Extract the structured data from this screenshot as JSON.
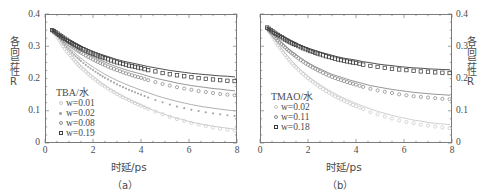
{
  "figure": {
    "axis_title_y": "各向异性R",
    "axis_title_x": "时延/ps",
    "caption_a": "（a）",
    "caption_b": "（b）"
  },
  "panels": {
    "a": {
      "legend_title": "TBA/水",
      "caption": "（a）",
      "yticks": [
        "0.4",
        "0.3",
        "0.2",
        "0.1",
        "0"
      ],
      "xticks": [
        "0",
        "2",
        "4",
        "6",
        "8"
      ]
    },
    "b": {
      "legend_title": "TMAO/水",
      "caption": "（b）",
      "yticks": [
        "0.4",
        "0.3",
        "0.2",
        "0.1",
        "0"
      ],
      "xticks": [
        "0",
        "2",
        "4",
        "6",
        "8"
      ]
    }
  },
  "chart_data": [
    {
      "type": "scatter",
      "panel": "a",
      "title": "TBA/水",
      "xlabel": "时延/ps",
      "ylabel": "各向异性R",
      "xlim": [
        0,
        8
      ],
      "ylim": [
        0,
        0.4
      ],
      "xticks": [
        0,
        2,
        4,
        6,
        8
      ],
      "yticks": [
        0,
        0.1,
        0.2,
        0.3,
        0.4
      ],
      "grid": false,
      "legend_position": "inside-left",
      "series": [
        {
          "name": "w=0.01",
          "marker": "circle-open",
          "color": "#c9c9c9",
          "points_x": [
            0.3,
            0.45,
            0.6,
            0.75,
            0.9,
            1.05,
            1.2,
            1.35,
            1.5,
            1.7,
            1.9,
            2.1,
            2.3,
            2.5,
            2.75,
            3.0,
            3.25,
            3.5,
            3.75,
            4.0,
            4.3,
            4.6,
            4.9,
            5.2,
            5.5,
            5.8,
            6.1,
            6.4,
            6.7,
            7.0,
            7.3,
            7.6,
            7.9
          ],
          "points_y": [
            0.35,
            0.335,
            0.318,
            0.3,
            0.285,
            0.272,
            0.258,
            0.245,
            0.234,
            0.221,
            0.208,
            0.196,
            0.185,
            0.175,
            0.163,
            0.152,
            0.142,
            0.133,
            0.124,
            0.116,
            0.106,
            0.097,
            0.089,
            0.081,
            0.074,
            0.068,
            0.062,
            0.057,
            0.052,
            0.048,
            0.044,
            0.041,
            0.038
          ],
          "fit_y": [
            0.35,
            0.334,
            0.319,
            0.304,
            0.29,
            0.277,
            0.264,
            0.252,
            0.24,
            0.226,
            0.213,
            0.201,
            0.189,
            0.178,
            0.166,
            0.155,
            0.145,
            0.135,
            0.126,
            0.118,
            0.108,
            0.099,
            0.091,
            0.083,
            0.077,
            0.071,
            0.065,
            0.06,
            0.056,
            0.052,
            0.049,
            0.046,
            0.043
          ]
        },
        {
          "name": "w=0.02",
          "marker": "dot-filled",
          "color": "#a8a8a8",
          "points_x": [
            0.3,
            0.45,
            0.6,
            0.75,
            0.9,
            1.05,
            1.2,
            1.35,
            1.5,
            1.7,
            1.9,
            2.1,
            2.3,
            2.5,
            2.75,
            3.0,
            3.25,
            3.5,
            3.75,
            4.0,
            4.3,
            4.6,
            4.9,
            5.2,
            5.5,
            5.8,
            6.1,
            6.4,
            6.7,
            7.0,
            7.3,
            7.6,
            7.9
          ],
          "points_y": [
            0.35,
            0.338,
            0.324,
            0.31,
            0.297,
            0.286,
            0.274,
            0.264,
            0.254,
            0.242,
            0.231,
            0.221,
            0.211,
            0.202,
            0.192,
            0.182,
            0.173,
            0.165,
            0.157,
            0.15,
            0.141,
            0.133,
            0.126,
            0.119,
            0.113,
            0.108,
            0.103,
            0.099,
            0.095,
            0.092,
            0.089,
            0.086,
            0.084
          ],
          "fit_y": [
            0.35,
            0.338,
            0.326,
            0.314,
            0.303,
            0.292,
            0.282,
            0.272,
            0.263,
            0.251,
            0.241,
            0.231,
            0.222,
            0.213,
            0.203,
            0.194,
            0.186,
            0.178,
            0.171,
            0.164,
            0.156,
            0.148,
            0.141,
            0.135,
            0.129,
            0.124,
            0.119,
            0.115,
            0.111,
            0.108,
            0.105,
            0.102,
            0.1
          ]
        },
        {
          "name": "w=0.08",
          "marker": "circle-open",
          "color": "#8a8a8a",
          "points_x": [
            0.3,
            0.45,
            0.6,
            0.75,
            0.9,
            1.05,
            1.2,
            1.35,
            1.5,
            1.7,
            1.9,
            2.1,
            2.3,
            2.5,
            2.75,
            3.0,
            3.25,
            3.5,
            3.75,
            4.0,
            4.3,
            4.6,
            4.9,
            5.2,
            5.5,
            5.8,
            6.1,
            6.4,
            6.7,
            7.0,
            7.3,
            7.6,
            7.9
          ],
          "points_y": [
            0.35,
            0.341,
            0.331,
            0.321,
            0.312,
            0.303,
            0.295,
            0.287,
            0.28,
            0.271,
            0.263,
            0.255,
            0.248,
            0.241,
            0.233,
            0.226,
            0.219,
            0.213,
            0.207,
            0.202,
            0.195,
            0.189,
            0.183,
            0.178,
            0.173,
            0.169,
            0.165,
            0.161,
            0.158,
            0.155,
            0.152,
            0.15,
            0.148
          ],
          "fit_y": [
            0.35,
            0.341,
            0.332,
            0.324,
            0.316,
            0.308,
            0.301,
            0.294,
            0.287,
            0.279,
            0.271,
            0.264,
            0.257,
            0.251,
            0.243,
            0.236,
            0.23,
            0.224,
            0.219,
            0.214,
            0.207,
            0.201,
            0.196,
            0.191,
            0.186,
            0.182,
            0.178,
            0.175,
            0.172,
            0.169,
            0.167,
            0.164,
            0.162
          ]
        },
        {
          "name": "w=0.19",
          "marker": "square-open",
          "color": "#3c3c3c",
          "points_x": [
            0.3,
            0.45,
            0.6,
            0.75,
            0.9,
            1.05,
            1.2,
            1.35,
            1.5,
            1.7,
            1.9,
            2.1,
            2.3,
            2.5,
            2.75,
            3.0,
            3.25,
            3.5,
            3.75,
            4.0,
            4.3,
            4.6,
            4.9,
            5.2,
            5.5,
            5.8,
            6.1,
            6.4,
            6.7,
            7.0,
            7.3,
            7.6,
            7.9
          ],
          "points_y": [
            0.35,
            0.343,
            0.335,
            0.327,
            0.32,
            0.313,
            0.306,
            0.3,
            0.294,
            0.287,
            0.28,
            0.274,
            0.268,
            0.263,
            0.256,
            0.25,
            0.245,
            0.24,
            0.236,
            0.232,
            0.226,
            0.222,
            0.217,
            0.213,
            0.21,
            0.207,
            0.204,
            0.201,
            0.199,
            0.197,
            0.195,
            0.193,
            0.192
          ],
          "fit_y": [
            0.35,
            0.343,
            0.336,
            0.329,
            0.323,
            0.317,
            0.311,
            0.305,
            0.3,
            0.293,
            0.287,
            0.281,
            0.276,
            0.271,
            0.265,
            0.259,
            0.254,
            0.25,
            0.246,
            0.242,
            0.237,
            0.233,
            0.229,
            0.225,
            0.222,
            0.219,
            0.216,
            0.214,
            0.212,
            0.21,
            0.208,
            0.207,
            0.205
          ]
        }
      ]
    },
    {
      "type": "scatter",
      "panel": "b",
      "title": "TMAO/水",
      "xlabel": "时延/ps",
      "ylabel": "各向异性R",
      "xlim": [
        0,
        8
      ],
      "ylim": [
        0,
        0.4
      ],
      "xticks": [
        0,
        2,
        4,
        6,
        8
      ],
      "yticks": [
        0,
        0.1,
        0.2,
        0.3,
        0.4
      ],
      "grid": false,
      "legend_position": "inside-left",
      "series": [
        {
          "name": "w=0.02",
          "marker": "circle-open",
          "color": "#c9c9c9",
          "points_x": [
            0.3,
            0.45,
            0.6,
            0.75,
            0.9,
            1.05,
            1.2,
            1.35,
            1.5,
            1.7,
            1.9,
            2.1,
            2.3,
            2.5,
            2.75,
            3.0,
            3.25,
            3.5,
            3.75,
            4.0,
            4.3,
            4.6,
            4.9,
            5.2,
            5.5,
            5.8,
            6.1,
            6.4,
            6.7,
            7.0,
            7.3,
            7.6,
            7.9
          ],
          "points_y": [
            0.355,
            0.338,
            0.32,
            0.303,
            0.288,
            0.273,
            0.259,
            0.246,
            0.234,
            0.22,
            0.207,
            0.195,
            0.184,
            0.173,
            0.161,
            0.15,
            0.14,
            0.131,
            0.122,
            0.114,
            0.105,
            0.096,
            0.089,
            0.082,
            0.076,
            0.07,
            0.065,
            0.061,
            0.057,
            0.054,
            0.051,
            0.048,
            0.046
          ],
          "fit_y": [
            0.355,
            0.338,
            0.322,
            0.306,
            0.292,
            0.278,
            0.265,
            0.253,
            0.241,
            0.227,
            0.214,
            0.202,
            0.191,
            0.181,
            0.169,
            0.158,
            0.148,
            0.139,
            0.131,
            0.123,
            0.114,
            0.106,
            0.098,
            0.092,
            0.086,
            0.08,
            0.076,
            0.071,
            0.068,
            0.064,
            0.061,
            0.059,
            0.057
          ]
        },
        {
          "name": "w=0.11",
          "marker": "circle-open",
          "color": "#8a8a8a",
          "points_x": [
            0.3,
            0.45,
            0.6,
            0.75,
            0.9,
            1.05,
            1.2,
            1.35,
            1.5,
            1.7,
            1.9,
            2.1,
            2.3,
            2.5,
            2.75,
            3.0,
            3.25,
            3.5,
            3.75,
            4.0,
            4.3,
            4.6,
            4.9,
            5.2,
            5.5,
            5.8,
            6.1,
            6.4,
            6.7,
            7.0,
            7.3,
            7.6,
            7.9
          ],
          "points_y": [
            0.355,
            0.343,
            0.33,
            0.318,
            0.307,
            0.296,
            0.286,
            0.277,
            0.268,
            0.257,
            0.247,
            0.238,
            0.23,
            0.222,
            0.213,
            0.205,
            0.198,
            0.192,
            0.186,
            0.181,
            0.174,
            0.168,
            0.163,
            0.159,
            0.155,
            0.151,
            0.148,
            0.145,
            0.143,
            0.141,
            0.139,
            0.137,
            0.136
          ],
          "fit_y": [
            0.355,
            0.343,
            0.332,
            0.321,
            0.311,
            0.301,
            0.292,
            0.283,
            0.275,
            0.264,
            0.254,
            0.245,
            0.237,
            0.23,
            0.221,
            0.213,
            0.207,
            0.201,
            0.195,
            0.19,
            0.184,
            0.178,
            0.174,
            0.17,
            0.166,
            0.163,
            0.16,
            0.157,
            0.155,
            0.153,
            0.151,
            0.15,
            0.148
          ]
        },
        {
          "name": "w=0.18",
          "marker": "square-open",
          "color": "#3c3c3c",
          "points_x": [
            0.3,
            0.45,
            0.6,
            0.75,
            0.9,
            1.05,
            1.2,
            1.35,
            1.5,
            1.7,
            1.9,
            2.1,
            2.3,
            2.5,
            2.75,
            3.0,
            3.25,
            3.5,
            3.75,
            4.0,
            4.3,
            4.6,
            4.9,
            5.2,
            5.5,
            5.8,
            6.1,
            6.4,
            6.7,
            7.0,
            7.3,
            7.6,
            7.9
          ],
          "points_y": [
            0.358,
            0.35,
            0.342,
            0.335,
            0.328,
            0.321,
            0.315,
            0.309,
            0.304,
            0.297,
            0.291,
            0.285,
            0.28,
            0.275,
            0.269,
            0.264,
            0.259,
            0.255,
            0.251,
            0.248,
            0.243,
            0.239,
            0.236,
            0.233,
            0.23,
            0.228,
            0.226,
            0.224,
            0.222,
            0.221,
            0.219,
            0.218,
            0.217
          ],
          "fit_y": [
            0.358,
            0.351,
            0.344,
            0.338,
            0.332,
            0.326,
            0.32,
            0.315,
            0.31,
            0.303,
            0.297,
            0.292,
            0.287,
            0.282,
            0.277,
            0.272,
            0.267,
            0.263,
            0.26,
            0.257,
            0.252,
            0.249,
            0.245,
            0.242,
            0.24,
            0.237,
            0.235,
            0.233,
            0.232,
            0.23,
            0.229,
            0.228,
            0.227
          ]
        }
      ]
    }
  ]
}
